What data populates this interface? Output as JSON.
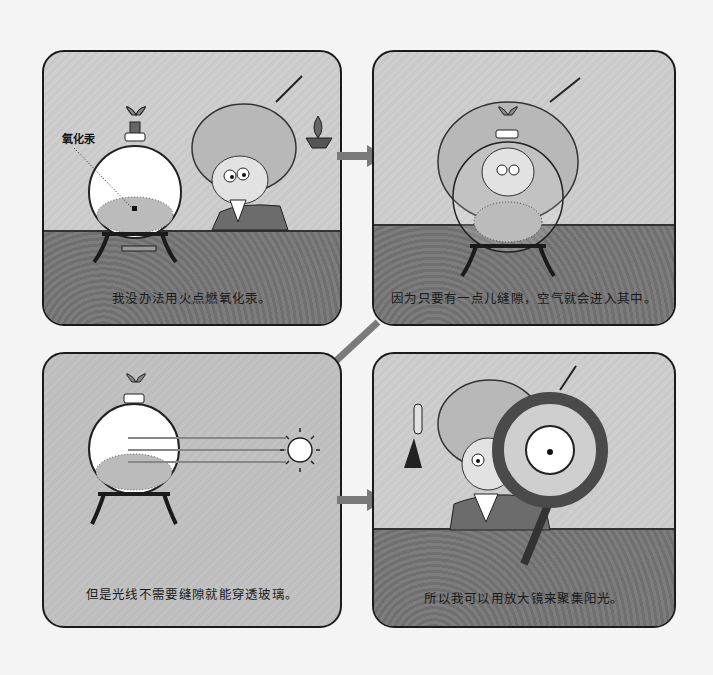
{
  "panels": [
    {
      "id": 1,
      "label": "氧化汞",
      "caption": "我没办法用火点燃氧化汞。",
      "scene": "scientist-with-candle-next-to-flask"
    },
    {
      "id": 2,
      "caption": "因为只要有一点儿缝隙，空气就会进入其中。",
      "scene": "scientist-behind-flask-angry"
    },
    {
      "id": 3,
      "caption": "但是光线不需要缝隙就能穿透玻璃。",
      "scene": "sunlight-passing-through-flask"
    },
    {
      "id": 4,
      "caption": "所以我可以用放大镜来聚集阳光。",
      "scene": "scientist-holding-magnifying-glass"
    }
  ],
  "arrows": [
    {
      "from": 1,
      "to": 2,
      "direction": "right"
    },
    {
      "from": 2,
      "to": 3,
      "direction": "down-left"
    },
    {
      "from": 3,
      "to": 4,
      "direction": "right"
    }
  ],
  "colors": {
    "page_bg": "#f4f4f4",
    "panel_border": "#1b1b1b",
    "wall": "#cbcbcb",
    "floor": "#777777",
    "arrow": "#7a7a7a"
  }
}
